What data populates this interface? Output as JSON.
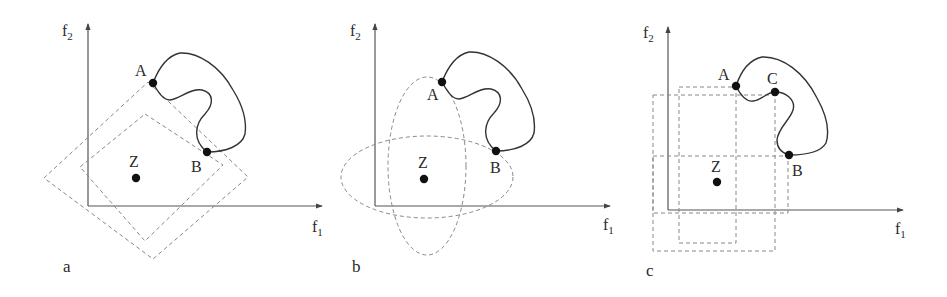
{
  "figure": {
    "panels": [
      {
        "id": "a",
        "label": "a",
        "x_axis_label": "f",
        "x_axis_sub": "1",
        "y_axis_label": "f",
        "y_axis_sub": "2",
        "points": [
          {
            "name": "A",
            "label": "A"
          },
          {
            "name": "B",
            "label": "B"
          },
          {
            "name": "Z",
            "label": "Z"
          }
        ],
        "overlay": "two rotated dashed squares (diamonds) centered near Z"
      },
      {
        "id": "b",
        "label": "b",
        "x_axis_label": "f",
        "x_axis_sub": "1",
        "y_axis_label": "f",
        "y_axis_sub": "2",
        "points": [
          {
            "name": "A",
            "label": "A"
          },
          {
            "name": "B",
            "label": "B"
          },
          {
            "name": "Z",
            "label": "Z"
          }
        ],
        "overlay": "two dashed ellipses (vertical and horizontal) centered near Z"
      },
      {
        "id": "c",
        "label": "c",
        "x_axis_label": "f",
        "x_axis_sub": "1",
        "y_axis_label": "f",
        "y_axis_sub": "2",
        "points": [
          {
            "name": "A",
            "label": "A"
          },
          {
            "name": "C",
            "label": "C"
          },
          {
            "name": "B",
            "label": "B"
          },
          {
            "name": "Z",
            "label": "Z"
          }
        ],
        "overlay": "three dashed axis-aligned rectangles with corners at A, C, B"
      }
    ],
    "colors": {
      "axis": "#555555",
      "front": "#333333",
      "dashed": "#888888",
      "point": "#111111"
    }
  }
}
